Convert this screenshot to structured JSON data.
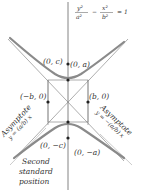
{
  "diagram": {
    "equation": {
      "numerator_left": "y²",
      "denominator_left": "a²",
      "operator": "−",
      "numerator_right": "x²",
      "denominator_right": "b²",
      "rhs": "= 1"
    },
    "points": {
      "focus_top": "(0, c)",
      "vertex_top": "(0, a)",
      "left_b": "(−b, 0)",
      "right_b": "(b, 0)",
      "focus_bottom": "(0, −c)",
      "vertex_bottom": "(0, −a)"
    },
    "asymptotes": {
      "left_title": "Asymptote",
      "left_equation": "y = (a/b) x",
      "right_title": "Asymptote",
      "right_equation": "y = −(a/b) x"
    },
    "caption": {
      "line1": "Second",
      "line2": "standard",
      "line3": "position"
    },
    "colors": {
      "curve": "#8a8a8a",
      "lines": "#555555",
      "text": "#333333"
    }
  }
}
